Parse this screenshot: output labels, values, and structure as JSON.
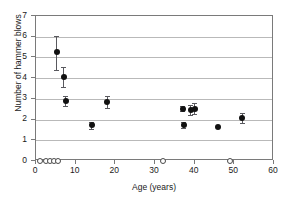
{
  "chart_data": {
    "type": "scatter",
    "title": "",
    "xlabel": "Age (years)",
    "ylabel": "Number of hammer blows",
    "xlim": [
      0,
      60
    ],
    "ylim": [
      0,
      7
    ],
    "xticks": [
      0,
      10,
      20,
      30,
      40,
      50,
      60
    ],
    "yticks": [
      0,
      1,
      2,
      3,
      4,
      5,
      6,
      7
    ],
    "grid": "horizontal",
    "legend": "none",
    "series": [
      {
        "name": "mean hammer blows with error bars",
        "marker": "filled-circle",
        "points": [
          {
            "x": 5.2,
            "y": 5.25,
            "yerr_low": 4.4,
            "yerr_high": 6.05
          },
          {
            "x": 7.0,
            "y": 4.05,
            "yerr_low": 3.55,
            "yerr_high": 4.55
          },
          {
            "x": 7.5,
            "y": 2.9,
            "yerr_low": 2.65,
            "yerr_high": 3.15
          },
          {
            "x": 14.0,
            "y": 1.72,
            "yerr_low": 1.55,
            "yerr_high": 1.9
          },
          {
            "x": 18.0,
            "y": 2.83,
            "yerr_low": 2.55,
            "yerr_high": 3.15
          },
          {
            "x": 37.0,
            "y": 2.52,
            "yerr_low": 2.4,
            "yerr_high": 2.65
          },
          {
            "x": 37.2,
            "y": 1.72,
            "yerr_low": 1.58,
            "yerr_high": 1.88
          },
          {
            "x": 39.0,
            "y": 2.45,
            "yerr_low": 2.2,
            "yerr_high": 2.72
          },
          {
            "x": 40.0,
            "y": 2.5,
            "yerr_low": 2.25,
            "yerr_high": 2.78
          },
          {
            "x": 46.0,
            "y": 1.62,
            "yerr_low": 1.62,
            "yerr_high": 1.62
          },
          {
            "x": 52.0,
            "y": 2.08,
            "yerr_low": 1.85,
            "yerr_high": 2.32
          }
        ]
      },
      {
        "name": "zero hammer blows",
        "marker": "open-circle",
        "points": [
          {
            "x": 1.0,
            "y": 0
          },
          {
            "x": 2.4,
            "y": 0
          },
          {
            "x": 3.5,
            "y": 0
          },
          {
            "x": 4.6,
            "y": 0
          },
          {
            "x": 5.6,
            "y": 0
          },
          {
            "x": 32.0,
            "y": 0
          },
          {
            "x": 49.0,
            "y": 0
          }
        ]
      }
    ]
  },
  "colors": {
    "filled_marker": "#111111",
    "open_marker_stroke": "#4a4a4a",
    "error_bar": "#59595e",
    "gridline": "#b9b9b9",
    "axis": "#7a7a7a",
    "text": "#1a1a1a",
    "background": "#ffffff"
  }
}
